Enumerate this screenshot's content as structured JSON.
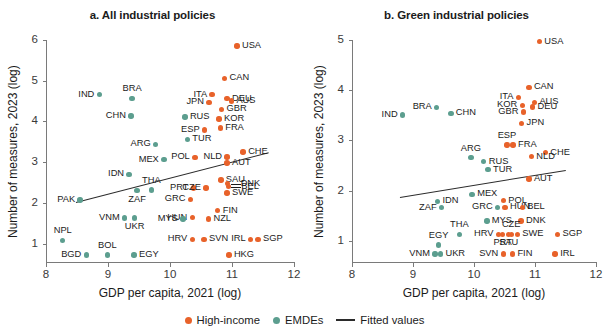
{
  "figure": {
    "xlabel": "GDP per capita, 2021 (log)",
    "ylabel": "Number of measures, 2023 (log)"
  },
  "legend": {
    "items": [
      {
        "label": "High-income",
        "marker": "dot",
        "color": "#e8622a"
      },
      {
        "label": "EMDEs",
        "marker": "dot",
        "color": "#5c9e8f"
      },
      {
        "label": "Fitted values",
        "marker": "line",
        "color": "#2b2b2b"
      }
    ]
  },
  "chart_data": [
    {
      "type": "scatter",
      "title": "a. All industrial policies",
      "xlabel": "GDP per capita, 2021 (log)",
      "ylabel": "Number of measures, 2023 (log)",
      "xlim": [
        8,
        12
      ],
      "ylim": [
        0.55,
        6
      ],
      "xticks": [
        8,
        9,
        10,
        11,
        12
      ],
      "yticks": [
        1,
        2,
        3,
        4,
        5,
        6
      ],
      "grid": false,
      "legend_position": "bottom",
      "series": [
        {
          "name": "High-income",
          "color": "#e8622a",
          "points": [
            {
              "label": "USA",
              "x": 11.08,
              "y": 5.85,
              "pos": "right"
            },
            {
              "label": "CAN",
              "x": 10.88,
              "y": 5.06,
              "pos": "right"
            },
            {
              "label": "ITA",
              "x": 10.68,
              "y": 4.66,
              "pos": "left"
            },
            {
              "label": "DEU",
              "x": 10.92,
              "y": 4.56,
              "pos": "right"
            },
            {
              "label": "AUS",
              "x": 10.99,
              "y": 4.5,
              "pos": "right"
            },
            {
              "label": "JPN",
              "x": 10.63,
              "y": 4.47,
              "pos": "left"
            },
            {
              "label": "GBR",
              "x": 10.83,
              "y": 4.3,
              "pos": "right"
            },
            {
              "label": "KOR",
              "x": 10.79,
              "y": 4.06,
              "pos": "right"
            },
            {
              "label": "FRA",
              "x": 10.81,
              "y": 3.84,
              "pos": "right"
            },
            {
              "label": "ESP",
              "x": 10.56,
              "y": 3.79,
              "pos": "left"
            },
            {
              "label": "CHE",
              "x": 11.18,
              "y": 3.25,
              "pos": "right"
            },
            {
              "label": "NLD",
              "x": 10.92,
              "y": 3.13,
              "pos": "left"
            },
            {
              "label": "POL",
              "x": 10.4,
              "y": 3.12,
              "pos": "left"
            },
            {
              "label": "AUT",
              "x": 10.92,
              "y": 2.98,
              "pos": "right"
            },
            {
              "label": "SAU",
              "x": 10.82,
              "y": 2.56,
              "pos": "right"
            },
            {
              "label": "DNK",
              "x": 10.93,
              "y": 2.47,
              "pos": "leader-right"
            },
            {
              "label": "BEL",
              "x": 10.94,
              "y": 2.4,
              "pos": "leader-right"
            },
            {
              "label": "PRT",
              "x": 10.38,
              "y": 2.37,
              "pos": "left"
            },
            {
              "label": "CZE",
              "x": 10.58,
              "y": 2.37,
              "pos": "left"
            },
            {
              "label": "SWE",
              "x": 10.92,
              "y": 2.24,
              "pos": "right"
            },
            {
              "label": "GRC",
              "x": 10.33,
              "y": 2.09,
              "pos": "left"
            },
            {
              "label": "FIN",
              "x": 10.77,
              "y": 1.81,
              "pos": "right"
            },
            {
              "label": "HUN",
              "x": 10.36,
              "y": 1.64,
              "pos": "left"
            },
            {
              "label": "NZL",
              "x": 10.62,
              "y": 1.61,
              "pos": "right"
            },
            {
              "label": "HRV",
              "x": 10.36,
              "y": 1.11,
              "pos": "left"
            },
            {
              "label": "SVN",
              "x": 10.55,
              "y": 1.11,
              "pos": "right"
            },
            {
              "label": "SGP",
              "x": 11.42,
              "y": 1.11,
              "pos": "right"
            },
            {
              "label": "IRL",
              "x": 11.3,
              "y": 1.11,
              "pos": "left"
            },
            {
              "label": "HKG",
              "x": 10.95,
              "y": 0.72,
              "pos": "right"
            }
          ]
        },
        {
          "name": "EMDEs",
          "color": "#5c9e8f",
          "points": [
            {
              "label": "IND",
              "x": 8.86,
              "y": 4.66,
              "pos": "left"
            },
            {
              "label": "BRA",
              "x": 9.39,
              "y": 4.57,
              "pos": "top"
            },
            {
              "label": "CHN",
              "x": 9.37,
              "y": 4.13,
              "pos": "left"
            },
            {
              "label": "RUS",
              "x": 10.24,
              "y": 4.11,
              "pos": "right"
            },
            {
              "label": "TUR",
              "x": 10.28,
              "y": 3.56,
              "pos": "right"
            },
            {
              "label": "ARG",
              "x": 9.77,
              "y": 3.44,
              "pos": "left"
            },
            {
              "label": "MEX",
              "x": 9.9,
              "y": 3.06,
              "pos": "left"
            },
            {
              "label": "IDN",
              "x": 9.34,
              "y": 2.7,
              "pos": "left"
            },
            {
              "label": "THA",
              "x": 9.7,
              "y": 2.32,
              "pos": "top"
            },
            {
              "label": "ZAF",
              "x": 9.47,
              "y": 2.3,
              "pos": "bottom"
            },
            {
              "label": "PAK",
              "x": 8.55,
              "y": 2.07,
              "pos": "left"
            },
            {
              "label": "VNM",
              "x": 9.27,
              "y": 1.63,
              "pos": "left"
            },
            {
              "label": "UKR",
              "x": 9.43,
              "y": 1.63,
              "pos": "bottom"
            },
            {
              "label": "MYS",
              "x": 10.21,
              "y": 1.61,
              "pos": "left"
            },
            {
              "label": "NPL",
              "x": 8.27,
              "y": 1.08,
              "pos": "top"
            },
            {
              "label": "BGD",
              "x": 8.65,
              "y": 0.72,
              "pos": "left"
            },
            {
              "label": "BOL",
              "x": 8.99,
              "y": 0.72,
              "pos": "top"
            },
            {
              "label": "EGY",
              "x": 9.42,
              "y": 0.72,
              "pos": "right"
            }
          ]
        }
      ],
      "fit_line": {
        "x0": 8.48,
        "y0": 2.03,
        "x1": 11.58,
        "y1": 3.25
      }
    },
    {
      "type": "scatter",
      "title": "b. Green industrial policies",
      "xlabel": "GDP per capita, 2021 (log)",
      "ylabel": "Number of measures, 2023 (log)",
      "xlim": [
        8,
        12
      ],
      "ylim": [
        0.58,
        5
      ],
      "xticks": [
        8,
        9,
        10,
        11,
        12
      ],
      "yticks": [
        1,
        2,
        3,
        4,
        5
      ],
      "grid": false,
      "legend_position": "bottom",
      "series": [
        {
          "name": "High-income",
          "color": "#e8622a",
          "points": [
            {
              "label": "USA",
              "x": 11.07,
              "y": 4.97,
              "pos": "right"
            },
            {
              "label": "CAN",
              "x": 10.9,
              "y": 4.06,
              "pos": "right"
            },
            {
              "label": "ITA",
              "x": 10.73,
              "y": 3.86,
              "pos": "left"
            },
            {
              "label": "AUS",
              "x": 10.99,
              "y": 3.76,
              "pos": "right"
            },
            {
              "label": "DEU",
              "x": 10.96,
              "y": 3.67,
              "pos": "right"
            },
            {
              "label": "KOR",
              "x": 10.79,
              "y": 3.7,
              "pos": "left"
            },
            {
              "label": "GBR",
              "x": 10.81,
              "y": 3.57,
              "pos": "left"
            },
            {
              "label": "JPN",
              "x": 10.78,
              "y": 3.34,
              "pos": "right"
            },
            {
              "label": "ESP",
              "x": 10.54,
              "y": 2.91,
              "pos": "top"
            },
            {
              "label": "FRA",
              "x": 10.64,
              "y": 2.91,
              "pos": "right"
            },
            {
              "label": "CHE",
              "x": 11.17,
              "y": 2.76,
              "pos": "right"
            },
            {
              "label": "NLD",
              "x": 10.94,
              "y": 2.68,
              "pos": "right"
            },
            {
              "label": "AUT",
              "x": 10.9,
              "y": 2.23,
              "pos": "right"
            },
            {
              "label": "POL",
              "x": 10.48,
              "y": 1.8,
              "pos": "right"
            },
            {
              "label": "HUN",
              "x": 10.51,
              "y": 1.67,
              "pos": "right"
            },
            {
              "label": "BEL",
              "x": 10.79,
              "y": 1.67,
              "pos": "right"
            },
            {
              "label": "DNK",
              "x": 10.77,
              "y": 1.4,
              "pos": "right"
            },
            {
              "label": "CZE",
              "x": 10.61,
              "y": 1.13,
              "pos": "top"
            },
            {
              "label": "HRV",
              "x": 10.4,
              "y": 1.13,
              "pos": "left"
            },
            {
              "label": "PRT",
              "x": 10.47,
              "y": 1.13,
              "pos": "bottom"
            },
            {
              "label": "SAU",
              "x": 10.57,
              "y": 1.13,
              "pos": "bottom"
            },
            {
              "label": "SWE",
              "x": 10.71,
              "y": 1.13,
              "pos": "right"
            },
            {
              "label": "SGP",
              "x": 11.37,
              "y": 1.13,
              "pos": "right"
            },
            {
              "label": "SVN",
              "x": 10.48,
              "y": 0.74,
              "pos": "left"
            },
            {
              "label": "FIN",
              "x": 10.63,
              "y": 0.74,
              "pos": "right"
            },
            {
              "label": "IRL",
              "x": 11.33,
              "y": 0.74,
              "pos": "right"
            }
          ]
        },
        {
          "name": "EMDEs",
          "color": "#5c9e8f",
          "points": [
            {
              "label": "IND",
              "x": 8.83,
              "y": 3.51,
              "pos": "left"
            },
            {
              "label": "BRA",
              "x": 9.39,
              "y": 3.66,
              "pos": "left"
            },
            {
              "label": "CHN",
              "x": 9.62,
              "y": 3.54,
              "pos": "right"
            },
            {
              "label": "ARG",
              "x": 9.95,
              "y": 2.66,
              "pos": "top"
            },
            {
              "label": "RUS",
              "x": 10.16,
              "y": 2.58,
              "pos": "right"
            },
            {
              "label": "TUR",
              "x": 10.23,
              "y": 2.42,
              "pos": "right"
            },
            {
              "label": "MEX",
              "x": 9.97,
              "y": 1.93,
              "pos": "right"
            },
            {
              "label": "IDN",
              "x": 9.4,
              "y": 1.79,
              "pos": "right"
            },
            {
              "label": "ZAF",
              "x": 9.47,
              "y": 1.66,
              "pos": "left"
            },
            {
              "label": "GRC",
              "x": 10.39,
              "y": 1.67,
              "pos": "left"
            },
            {
              "label": "MYS",
              "x": 10.21,
              "y": 1.4,
              "pos": "right"
            },
            {
              "label": "THA",
              "x": 9.76,
              "y": 1.13,
              "pos": "top"
            },
            {
              "label": "VNM",
              "x": 9.36,
              "y": 0.74,
              "pos": "left"
            },
            {
              "label": "UKR",
              "x": 9.45,
              "y": 0.74,
              "pos": "right"
            },
            {
              "label": "EGY",
              "x": 9.42,
              "y": 0.92,
              "pos": "top"
            }
          ]
        }
      ],
      "fit_line": {
        "x0": 8.78,
        "y0": 1.88,
        "x1": 11.5,
        "y1": 2.42
      }
    }
  ]
}
